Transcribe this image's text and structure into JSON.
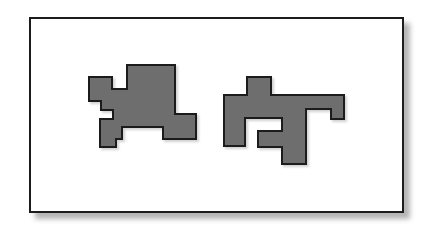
{
  "figure": {
    "canvas": {
      "width": 429,
      "height": 229,
      "background": "#ffffff"
    },
    "frame": {
      "name": "figure-border",
      "x": 30,
      "y": 18,
      "width": 373,
      "height": 194,
      "fill": "#ffffff",
      "stroke": "#1a1a1a",
      "stroke_width": 2,
      "shadow": {
        "color": "#b4b4b4",
        "offset_x": 6,
        "offset_y": 6,
        "blur": 4
      }
    },
    "shapes": [
      {
        "id": "shape-left",
        "label": "Left rectilinear polygon",
        "fill": "#6e6e6e",
        "stroke": "#1a1a1a",
        "stroke_width": 2,
        "points": "89,89 89,77 112,77 112,89 127,89 127,65 175,65 175,114 196,114 196,139 163,139 163,127 122,127 122,139 116,139 116,147 100,147 100,119 113,119 113,110 101,110 101,101 89,101"
      },
      {
        "id": "shape-right",
        "label": "Right rectilinear polygon",
        "fill": "#6e6e6e",
        "stroke": "#1a1a1a",
        "stroke_width": 2,
        "points": "224,95 247,95 247,77 271,77 271,95 344,95 344,119 331,119 331,109 306,109 306,164 282,164 282,147 258,147 258,131 282,131 282,118 245,118 245,146 224,146"
      }
    ]
  }
}
